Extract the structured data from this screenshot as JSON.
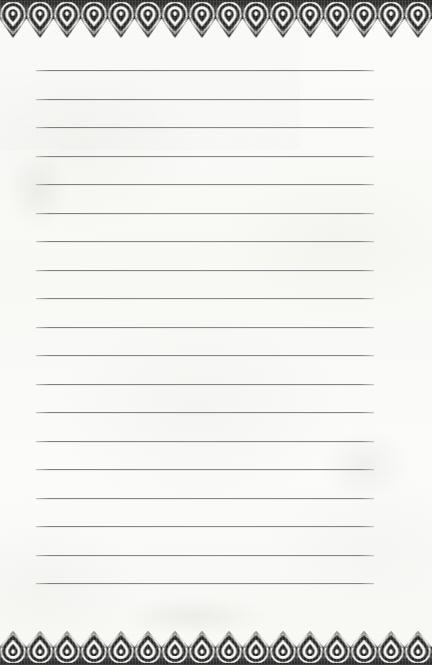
{
  "document": {
    "kind": "lined-notepaper",
    "title": "Ornate Bordered Lined Notepaper",
    "page_width": 432,
    "page_height": 665,
    "paper_color": "#fbfbf8",
    "body_text": "",
    "written_content": []
  },
  "ornament": {
    "ink_color": "#2b2b2b",
    "ink_color_mid": "#4a4a4a",
    "highlight_color": "#f7f7f4",
    "motif_name": "teardrop-paisley",
    "motif_count": 16,
    "motif_width": 27,
    "top": {
      "name": "top-ornamental-border",
      "height": 38,
      "direction": "points-down"
    },
    "bottom": {
      "name": "bottom-ornamental-border",
      "height": 34,
      "direction": "points-up"
    }
  },
  "rules": {
    "name": "ruled-writing-lines",
    "count": 19,
    "color": "#848486",
    "left": 36,
    "right": 374,
    "first_y": 70,
    "spacing": 28.5,
    "y_positions": [
      70,
      98.5,
      127,
      155.5,
      184,
      212.5,
      241,
      269.5,
      298,
      326.5,
      355,
      383.5,
      412,
      440.5,
      469,
      497.5,
      526,
      554.5,
      583
    ]
  }
}
